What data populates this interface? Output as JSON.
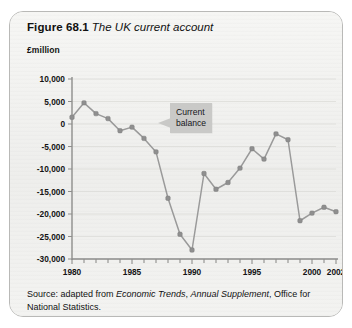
{
  "figure": {
    "number_label": "Figure 68.1",
    "caption": "The UK current account"
  },
  "source": {
    "prefix": "Source: adapted from ",
    "italic_1": "Economic Trends",
    "mid": ", ",
    "italic_2": "Annual Supplement",
    "suffix": ", Office for National Statistics."
  },
  "callout": {
    "line1": "Current",
    "line2": "balance"
  },
  "colors": {
    "card_background": "#f2f2f0",
    "card_border": "#b9b9b7",
    "line": "#9a9a9a",
    "marker": "#8f8f8f",
    "gridline": "#dcdcd8",
    "axis": "#8e8e8c",
    "callout_background": "#c9c9c7",
    "text": "#111111"
  },
  "chart_data": {
    "type": "line",
    "title": "The UK current account",
    "xlabel": "",
    "ylabel": "£million",
    "ylim": [
      -30000,
      10000
    ],
    "xlim": [
      1980,
      2002
    ],
    "ytick_labels": [
      "10,000",
      "5,000",
      "0",
      "-5,000",
      "-10,000",
      "-15,000",
      "-20,000",
      "-25,000",
      "-30,000"
    ],
    "yticks": [
      10000,
      5000,
      0,
      -5000,
      -10000,
      -15000,
      -20000,
      -25000,
      -30000
    ],
    "xtick_labels": [
      "1980",
      "1985",
      "1990",
      "1995",
      "2000",
      "2002"
    ],
    "xticks": [
      1980,
      1985,
      1990,
      1995,
      2000,
      2002
    ],
    "grid": true,
    "legend": "Current balance",
    "legend_position": "inline-callout",
    "series": [
      {
        "name": "Current balance",
        "x": [
          1980,
          1981,
          1982,
          1983,
          1984,
          1985,
          1986,
          1987,
          1988,
          1989,
          1990,
          1991,
          1992,
          1993,
          1994,
          1995,
          1996,
          1997,
          1998,
          1999,
          2000,
          2001,
          2002
        ],
        "values": [
          1500,
          4700,
          2300,
          1200,
          -1500,
          -700,
          -3200,
          -6200,
          -16500,
          -24500,
          -28000,
          -11000,
          -14500,
          -13000,
          -9800,
          -5500,
          -7800,
          -2200,
          -3500,
          -21500,
          -19800,
          -18500,
          -19500
        ]
      }
    ]
  }
}
